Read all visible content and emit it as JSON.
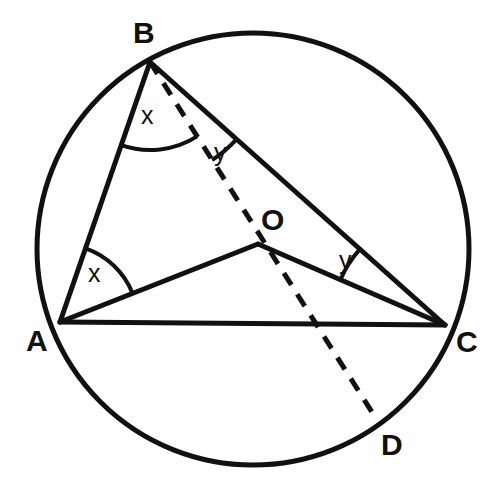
{
  "figure": {
    "type": "circle-geometry-diagram",
    "stroke_color": "#111111",
    "background_color": "#ffffff",
    "circle": {
      "center": {
        "x": 253,
        "y": 249
      },
      "radius": 216,
      "stroke_width": 5
    },
    "points": {
      "A": {
        "x": 60,
        "y": 322
      },
      "B": {
        "x": 150,
        "y": 62
      },
      "C": {
        "x": 445,
        "y": 325
      },
      "D": {
        "x": 377,
        "y": 420
      },
      "O": {
        "x": 258,
        "y": 244
      }
    },
    "solid_segments": [
      {
        "name": "AB",
        "from": "A",
        "to": "B"
      },
      {
        "name": "AC",
        "from": "A",
        "to": "C"
      },
      {
        "name": "AO",
        "from": "A",
        "to": "O"
      },
      {
        "name": "BC",
        "from": "B",
        "to": "C"
      },
      {
        "name": "OC",
        "from": "O",
        "to": "C"
      }
    ],
    "dashed_segments": [
      {
        "name": "BD",
        "from": "B",
        "to": "D",
        "dash_pattern": "14 11"
      }
    ],
    "angle_arcs": [
      {
        "name": "angle-ABD-at-B",
        "vertex": "B",
        "label": "x",
        "between": [
          "BA",
          "BD"
        ],
        "radius": 88
      },
      {
        "name": "angle-DBC-at-B",
        "vertex": "B",
        "label": "y",
        "between": [
          "BD",
          "BC"
        ],
        "radius": 116
      },
      {
        "name": "angle-BAO-at-A",
        "vertex": "A",
        "label": "x",
        "between": [
          "AB",
          "AO"
        ],
        "radius": 78
      },
      {
        "name": "angle-BCO-at-C",
        "vertex": "C",
        "label": "y",
        "between": [
          "CB",
          "CO"
        ],
        "radius": 114
      }
    ]
  },
  "labels": {
    "A": "A",
    "B": "B",
    "C": "C",
    "D": "D",
    "O": "O",
    "x_at_B": "x",
    "x_at_A": "x",
    "y_at_B": "y",
    "y_at_C": "y"
  }
}
